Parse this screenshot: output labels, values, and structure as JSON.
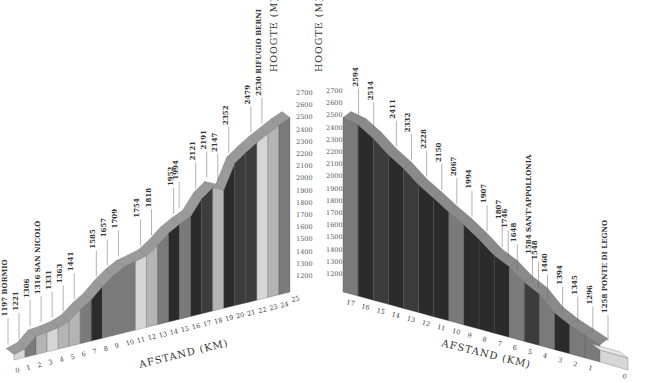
{
  "chart_data": [
    {
      "type": "bar",
      "title": "Bormio - Rifugio Berni",
      "xlabel": "AFSTAND (KM)",
      "ylabel": "HOOGTE (M)",
      "ylim": [
        1200,
        2700
      ],
      "yticks": [
        1200,
        1300,
        1400,
        1500,
        1600,
        1700,
        1800,
        1900,
        2000,
        2100,
        2200,
        2300,
        2400,
        2500,
        2600,
        2700
      ],
      "categories": [
        "0",
        "1",
        "2",
        "3",
        "4",
        "5",
        "6",
        "7",
        "8",
        "9",
        "10",
        "11",
        "12",
        "13",
        "14",
        "15",
        "16",
        "17",
        "18",
        "19",
        "20",
        "21",
        "22",
        "23",
        "24",
        "25"
      ],
      "values": [
        1197,
        1221,
        1306,
        1316,
        1331,
        1363,
        1441,
        1585,
        1657,
        1709,
        1754,
        1818,
        1952,
        1994,
        2121,
        2191,
        2147,
        2352,
        2479,
        2530
      ],
      "annotations": [
        {
          "km": 0,
          "elev": "1197",
          "label": "1197 BORMIO"
        },
        {
          "km": 1,
          "elev": "1221",
          "label": "1221"
        },
        {
          "km": 2,
          "elev": "1306",
          "label": "1306"
        },
        {
          "km": 3,
          "elev": "1316",
          "label": "1316 SAN NICOLÒ"
        },
        {
          "km": 4,
          "elev": "1331",
          "label": "1331"
        },
        {
          "km": 5,
          "elev": "1363",
          "label": "1363"
        },
        {
          "km": 6,
          "elev": "1441",
          "label": "1441"
        },
        {
          "km": 8,
          "elev": "1585",
          "label": "1585"
        },
        {
          "km": 9,
          "elev": "1657",
          "label": "1657"
        },
        {
          "km": 10,
          "elev": "1709",
          "label": "1709"
        },
        {
          "km": 12,
          "elev": "1754",
          "label": "1754"
        },
        {
          "km": 13,
          "elev": "1818",
          "label": "1818"
        },
        {
          "km": 15,
          "elev": "1952",
          "label": "1952"
        },
        {
          "km": 15.5,
          "elev": "1994",
          "label": "1994"
        },
        {
          "km": 17,
          "elev": "2121",
          "label": "2121"
        },
        {
          "km": 18,
          "elev": "2191",
          "label": "2191"
        },
        {
          "km": 19,
          "elev": "2147",
          "label": "2147"
        },
        {
          "km": 20,
          "elev": "2352",
          "label": "2352"
        },
        {
          "km": 22,
          "elev": "2479",
          "label": "2479"
        },
        {
          "km": 23,
          "elev": "2530",
          "label": "2530 RIFUGIO BERNI"
        }
      ]
    },
    {
      "type": "bar",
      "title": "Ponte di Legno - summit",
      "xlabel": "AFSTAND (KM)",
      "ylabel": "HOOGTE (M)",
      "ylim": [
        1200,
        2700
      ],
      "yticks": [
        1200,
        1300,
        1400,
        1500,
        1600,
        1700,
        1800,
        1900,
        2000,
        2100,
        2200,
        2300,
        2400,
        2500,
        2600,
        2700
      ],
      "categories": [
        "17",
        "16",
        "15",
        "14",
        "13",
        "12",
        "11",
        "10",
        "9",
        "8",
        "7",
        "6",
        "5",
        "4",
        "3",
        "2",
        "1",
        "0"
      ],
      "values": [
        2594,
        2514,
        2411,
        2332,
        2228,
        2150,
        2067,
        1994,
        1907,
        1807,
        1746,
        1648,
        1584,
        1548,
        1460,
        1394,
        1345,
        1296,
        1258
      ],
      "annotations": [
        {
          "km": 16.5,
          "elev": "2594",
          "label": "2594"
        },
        {
          "km": 15.5,
          "elev": "2514",
          "label": "2514"
        },
        {
          "km": 14,
          "elev": "2411",
          "label": "2411"
        },
        {
          "km": 13,
          "elev": "2332",
          "label": "2332"
        },
        {
          "km": 12,
          "elev": "2228",
          "label": "2228"
        },
        {
          "km": 11,
          "elev": "2150",
          "label": "2150"
        },
        {
          "km": 10,
          "elev": "2067",
          "label": "2067"
        },
        {
          "km": 9,
          "elev": "1994",
          "label": "1994"
        },
        {
          "km": 8,
          "elev": "1907",
          "label": "1907"
        },
        {
          "km": 7,
          "elev": "1807",
          "label": "1807"
        },
        {
          "km": 6.6,
          "elev": "1746",
          "label": "1746"
        },
        {
          "km": 6,
          "elev": "1648",
          "label": "1648"
        },
        {
          "km": 5,
          "elev": "1584",
          "label": "1584 SANT'APPOLLONIA"
        },
        {
          "km": 4.6,
          "elev": "1548",
          "label": "1548"
        },
        {
          "km": 4,
          "elev": "1460",
          "label": "1460"
        },
        {
          "km": 3,
          "elev": "1394",
          "label": "1394"
        },
        {
          "km": 2,
          "elev": "1345",
          "label": "1345"
        },
        {
          "km": 1,
          "elev": "1296",
          "label": "1296"
        },
        {
          "km": 0,
          "elev": "1258",
          "label": "1258 PONTE DI LEGNO"
        }
      ]
    }
  ],
  "left": {
    "ylabel": "HOOGTE (M)",
    "xlabel": "AFSTAND (KM)"
  },
  "right": {
    "ylabel": "HOOGTE (M)",
    "xlabel": "AFSTAND (KM)"
  },
  "colors": {
    "very_dark": "#2b2b2b",
    "dark": "#3c3c3c",
    "medium": "#7a7a7a",
    "light": "#b4b4b4",
    "very_light": "#d6d6d6",
    "text": "#333333"
  }
}
